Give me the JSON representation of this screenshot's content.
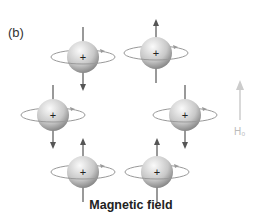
{
  "panel_label": "(b)",
  "caption": "Magnetic field",
  "field_label": "H₀",
  "colors": {
    "sphere_light": "#f2f2f2",
    "sphere_dark": "#8a8a8a",
    "arrow": "#555555",
    "field_arrow": "#cccccc"
  },
  "spins": [
    {
      "name": "spin-top-left",
      "cx": 83,
      "cy": 57,
      "dir": "down"
    },
    {
      "name": "spin-top-right",
      "cx": 156,
      "cy": 53,
      "dir": "up"
    },
    {
      "name": "spin-middle-left",
      "cx": 53,
      "cy": 115,
      "dir": "down"
    },
    {
      "name": "spin-middle-right",
      "cx": 185,
      "cy": 115,
      "dir": "down"
    },
    {
      "name": "spin-bottom-left",
      "cx": 83,
      "cy": 172,
      "dir": "up"
    },
    {
      "name": "spin-bottom-right",
      "cx": 157,
      "cy": 172,
      "dir": "up"
    }
  ]
}
